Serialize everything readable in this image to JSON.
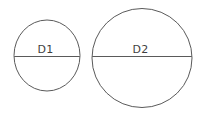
{
  "figure": {
    "background_color": "#ffffff",
    "stroke_color": "#5a5a5a",
    "label_color": "#3f3f3f",
    "width": 201,
    "height": 114
  },
  "chart_data": {
    "type": "diagram",
    "title": "",
    "xlabel": "",
    "ylabel": "",
    "shapes": [
      {
        "name": "small-circle",
        "label": "D1",
        "cx": 47,
        "cy": 55.5,
        "rx": 33,
        "ry": 35.5,
        "diameter_line_y": 56.5,
        "label_x": 45.5,
        "label_y": 52.5
      },
      {
        "name": "large-circle",
        "label": "D2",
        "cx": 142,
        "cy": 58,
        "rx": 50,
        "ry": 49.5,
        "diameter_line_y": 56.5,
        "label_x": 140.5,
        "label_y": 52.5
      }
    ],
    "legend": [],
    "annotations": [
      "D1",
      "D2"
    ]
  },
  "labels": {
    "small_circle": "D1",
    "large_circle": "D2"
  }
}
